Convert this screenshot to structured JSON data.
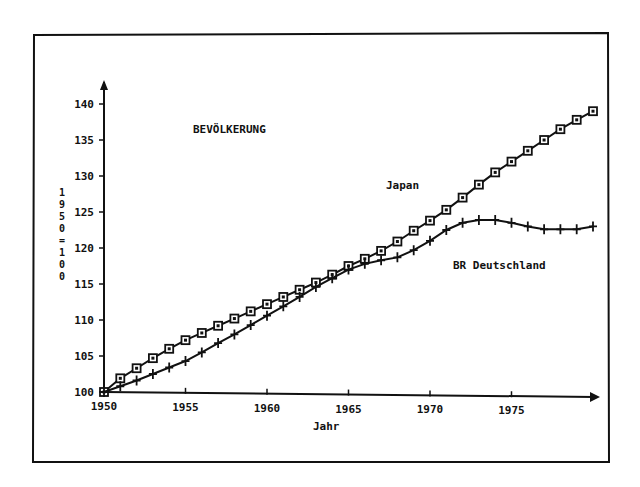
{
  "chart_data": {
    "type": "line",
    "title": "BEVÖLKERUNG",
    "xlabel": "Jahr",
    "ylabel": "1950=100",
    "x_ticks": [
      "1950",
      "1955",
      "1960",
      "1965",
      "1970",
      "1975"
    ],
    "y_ticks": [
      "100",
      "105",
      "110",
      "115",
      "120",
      "125",
      "130",
      "135",
      "140"
    ],
    "xlim": [
      1950,
      1980
    ],
    "ylim": [
      100,
      142
    ],
    "grid": false,
    "legend_position": "inline annotations",
    "x": [
      1950,
      1951,
      1952,
      1953,
      1954,
      1955,
      1956,
      1957,
      1958,
      1959,
      1960,
      1961,
      1962,
      1963,
      1964,
      1965,
      1966,
      1967,
      1968,
      1969,
      1970,
      1971,
      1972,
      1973,
      1974,
      1975,
      1976,
      1977,
      1978,
      1979,
      1980
    ],
    "series": [
      {
        "name": "Japan",
        "marker": "square",
        "values": [
          100,
          101.9,
          103.3,
          104.7,
          106.0,
          107.2,
          108.2,
          109.2,
          110.2,
          111.2,
          112.2,
          113.2,
          114.2,
          115.2,
          116.3,
          117.5,
          118.5,
          119.6,
          120.9,
          122.4,
          123.8,
          125.3,
          127.0,
          128.8,
          130.5,
          132.0,
          133.5,
          135.0,
          136.5,
          137.8,
          139.0
        ]
      },
      {
        "name": "BR Deutschland",
        "marker": "plus",
        "values": [
          100,
          100.8,
          101.6,
          102.5,
          103.4,
          104.3,
          105.5,
          106.8,
          108.0,
          109.3,
          110.6,
          111.9,
          113.2,
          114.6,
          115.8,
          117.0,
          117.8,
          118.3,
          118.7,
          119.7,
          121.0,
          122.5,
          123.5,
          123.9,
          123.9,
          123.5,
          123.0,
          122.6,
          122.6,
          122.6,
          123.0
        ]
      }
    ],
    "annotations": [
      {
        "text": "BEVÖLKERUNG",
        "role": "title"
      },
      {
        "text": "Japan",
        "role": "series-label"
      },
      {
        "text": "BR Deutschland",
        "role": "series-label"
      }
    ]
  },
  "labels": {
    "title": "BEVÖLKERUNG",
    "japan": "Japan",
    "germany": "BR Deutschland",
    "xlabel": "Jahr",
    "ylabel_chars": [
      "1",
      "9",
      "5",
      "0",
      "=",
      "1",
      "0",
      "0"
    ]
  },
  "colors": {
    "ink": "#111111",
    "background": "#ffffff"
  }
}
